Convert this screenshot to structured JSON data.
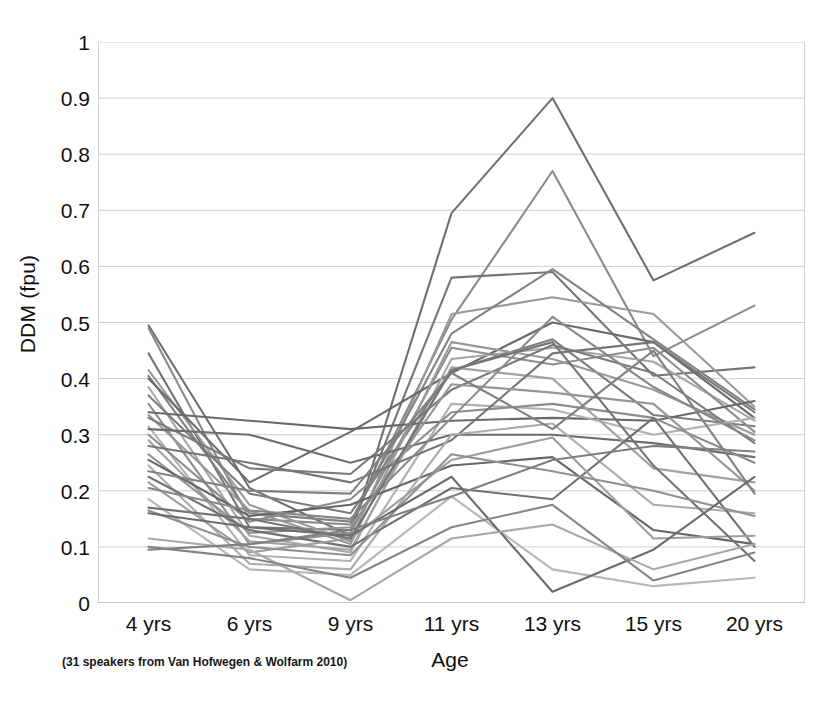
{
  "chart_data": {
    "type": "line",
    "title": "",
    "subtitle": "",
    "xlabel": "Age",
    "ylabel": "DDM (fpu)",
    "categories": [
      "4 yrs",
      "6 yrs",
      "9 yrs",
      "11 yrs",
      "13 yrs",
      "15 yrs",
      "20 yrs"
    ],
    "ytick_labels": [
      "0",
      "0.1",
      "0.2",
      "0.3",
      "0.4",
      "0.5",
      "0.6",
      "0.7",
      "0.8",
      "0.9",
      "1"
    ],
    "ytick_values": [
      0,
      0.1,
      0.2,
      0.3,
      0.4,
      0.5,
      0.6,
      0.7,
      0.8,
      0.9,
      1
    ],
    "ylim": [
      0,
      1
    ],
    "grid": "horizontal",
    "legend": "none",
    "annotation": "(31 speakers from Van Hofwegen & Wolfarm 2010)",
    "series_count": 31,
    "series": [
      {
        "name": "speaker-01",
        "color": "#6f6f6f",
        "values": [
          0.495,
          0.205,
          0.12,
          0.695,
          0.9,
          0.575,
          0.66
        ]
      },
      {
        "name": "speaker-02",
        "color": "#8a8a8a",
        "values": [
          0.49,
          0.15,
          0.14,
          0.505,
          0.77,
          0.44,
          0.53
        ]
      },
      {
        "name": "speaker-03",
        "color": "#757575",
        "values": [
          0.445,
          0.135,
          0.13,
          0.58,
          0.59,
          0.405,
          0.42
        ]
      },
      {
        "name": "speaker-04",
        "color": "#9a9a9a",
        "values": [
          0.415,
          0.175,
          0.11,
          0.515,
          0.545,
          0.515,
          0.35
        ]
      },
      {
        "name": "speaker-05",
        "color": "#828282",
        "values": [
          0.405,
          0.16,
          0.145,
          0.48,
          0.595,
          0.47,
          0.345
        ]
      },
      {
        "name": "speaker-06",
        "color": "#6b6b6b",
        "values": [
          0.4,
          0.215,
          0.305,
          0.41,
          0.5,
          0.465,
          0.33
        ]
      },
      {
        "name": "speaker-07",
        "color": "#a6a6a6",
        "values": [
          0.385,
          0.12,
          0.09,
          0.435,
          0.455,
          0.43,
          0.325
        ]
      },
      {
        "name": "speaker-08",
        "color": "#7d7d7d",
        "values": [
          0.37,
          0.195,
          0.16,
          0.415,
          0.47,
          0.335,
          0.315
        ]
      },
      {
        "name": "speaker-09",
        "color": "#8e8e8e",
        "values": [
          0.355,
          0.105,
          0.125,
          0.455,
          0.425,
          0.455,
          0.305
        ]
      },
      {
        "name": "speaker-10",
        "color": "#696969",
        "values": [
          0.34,
          0.325,
          0.31,
          0.325,
          0.33,
          0.325,
          0.36
        ]
      },
      {
        "name": "speaker-11",
        "color": "#999999",
        "values": [
          0.335,
          0.165,
          0.105,
          0.465,
          0.435,
          0.38,
          0.3
        ]
      },
      {
        "name": "speaker-12",
        "color": "#7a7a7a",
        "values": [
          0.33,
          0.24,
          0.23,
          0.38,
          0.46,
          0.41,
          0.285
        ]
      },
      {
        "name": "speaker-13",
        "color": "#b0b0b0",
        "values": [
          0.315,
          0.085,
          0.075,
          0.355,
          0.345,
          0.3,
          0.33
        ]
      },
      {
        "name": "speaker-14",
        "color": "#6e6e6e",
        "values": [
          0.31,
          0.3,
          0.25,
          0.3,
          0.3,
          0.285,
          0.26
        ]
      },
      {
        "name": "speaker-15",
        "color": "#8c8c8c",
        "values": [
          0.3,
          0.145,
          0.185,
          0.34,
          0.355,
          0.33,
          0.25
        ]
      },
      {
        "name": "speaker-16",
        "color": "#a2a2a2",
        "values": [
          0.29,
          0.11,
          0.095,
          0.42,
          0.4,
          0.24,
          0.215
        ]
      },
      {
        "name": "speaker-17",
        "color": "#767676",
        "values": [
          0.28,
          0.25,
          0.215,
          0.29,
          0.445,
          0.465,
          0.34
        ]
      },
      {
        "name": "speaker-18",
        "color": "#959595",
        "values": [
          0.265,
          0.125,
          0.135,
          0.39,
          0.375,
          0.355,
          0.2
        ]
      },
      {
        "name": "speaker-19",
        "color": "#666666",
        "values": [
          0.255,
          0.155,
          0.175,
          0.245,
          0.26,
          0.13,
          0.105
        ]
      },
      {
        "name": "speaker-20",
        "color": "#ababab",
        "values": [
          0.245,
          0.07,
          0.06,
          0.3,
          0.32,
          0.175,
          0.16
        ]
      },
      {
        "name": "speaker-21",
        "color": "#818181",
        "values": [
          0.235,
          0.2,
          0.195,
          0.41,
          0.31,
          0.45,
          0.195
        ]
      },
      {
        "name": "speaker-22",
        "color": "#717171",
        "values": [
          0.225,
          0.13,
          0.1,
          0.205,
          0.185,
          0.33,
          0.1
        ]
      },
      {
        "name": "speaker-23",
        "color": "#9e9e9e",
        "values": [
          0.215,
          0.09,
          0.115,
          0.255,
          0.295,
          0.115,
          0.12
        ]
      },
      {
        "name": "speaker-24",
        "color": "#888888",
        "values": [
          0.205,
          0.165,
          0.15,
          0.33,
          0.51,
          0.385,
          0.29
        ]
      },
      {
        "name": "speaker-25",
        "color": "#b6b6b6",
        "values": [
          0.185,
          0.06,
          0.05,
          0.19,
          0.06,
          0.03,
          0.045
        ]
      },
      {
        "name": "speaker-26",
        "color": "#737373",
        "values": [
          0.17,
          0.15,
          0.115,
          0.415,
          0.465,
          0.245,
          0.075
        ]
      },
      {
        "name": "speaker-27",
        "color": "#909090",
        "values": [
          0.165,
          0.1,
          0.085,
          0.265,
          0.235,
          0.2,
          0.155
        ]
      },
      {
        "name": "speaker-28",
        "color": "#6c6c6c",
        "values": [
          0.16,
          0.135,
          0.12,
          0.225,
          0.02,
          0.095,
          0.225
        ]
      },
      {
        "name": "speaker-29",
        "color": "#a8a8a8",
        "values": [
          0.115,
          0.095,
          0.005,
          0.115,
          0.14,
          0.06,
          0.105
        ]
      },
      {
        "name": "speaker-30",
        "color": "#858585",
        "values": [
          0.1,
          0.08,
          0.045,
          0.135,
          0.175,
          0.04,
          0.09
        ]
      },
      {
        "name": "speaker-31",
        "color": "#7f7f7f",
        "values": [
          0.095,
          0.105,
          0.13,
          0.19,
          0.255,
          0.28,
          0.27
        ]
      }
    ]
  }
}
